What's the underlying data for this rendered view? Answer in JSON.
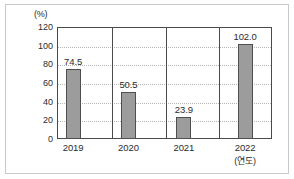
{
  "chart_data": {
    "type": "bar",
    "title": "",
    "subtitle": "",
    "xlabel": "(연도)",
    "ylabel": "(%)",
    "categories": [
      "2019",
      "2020",
      "2021",
      "2022"
    ],
    "values": [
      74.5,
      50.5,
      23.9,
      102.0
    ],
    "data_labels": [
      "74.5",
      "50.5",
      "23.9",
      "102.0"
    ],
    "ylim": [
      0,
      120
    ],
    "ytick_values": [
      0,
      20,
      40,
      60,
      80,
      100,
      120
    ],
    "ytick_labels": [
      "0",
      "20",
      "40",
      "60",
      "80",
      "100",
      "120"
    ],
    "grid": true,
    "grid_axis": "y",
    "grid_style": "dotted",
    "legend": false,
    "legend_position": "none",
    "series": [
      {
        "name": "",
        "values": [
          74.5,
          50.5,
          23.9,
          102.0
        ]
      }
    ]
  },
  "axes": {
    "unit_label": "(%)",
    "x_axis_note": "(연도)"
  },
  "colors": {
    "bar_fill": "#9c9c9c",
    "bar_stroke": "#4f4f4f",
    "gridline": "#b6b6b6",
    "axis": "#4a4a4a",
    "text": "#2b2b2b",
    "outer_border": "#c9c9c9",
    "background": "#ffffff"
  }
}
